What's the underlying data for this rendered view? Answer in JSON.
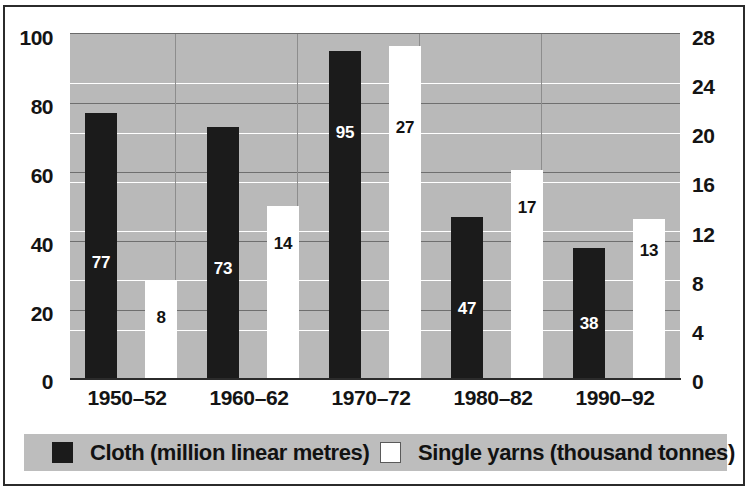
{
  "chart_data": {
    "type": "bar",
    "title": "",
    "subtitle": "",
    "xlabel": "",
    "categories": [
      "1950–52",
      "1960–62",
      "1970–72",
      "1980–82",
      "1990–92"
    ],
    "series": [
      {
        "name": "Cloth (million linear metres)",
        "axis": "left",
        "color": "#1b1b1b",
        "values": [
          77,
          73,
          95,
          47,
          38
        ]
      },
      {
        "name": "Single yarns (thousand tonnes)",
        "axis": "right",
        "color": "#ffffff",
        "values": [
          8,
          14,
          27,
          17,
          13
        ]
      }
    ],
    "left_axis": {
      "label": "",
      "ylim": [
        0,
        100
      ],
      "tick_step": 20,
      "ticks": [
        "0",
        "20",
        "40",
        "60",
        "80",
        "100"
      ]
    },
    "right_axis": {
      "label": "",
      "ylim": [
        0,
        28
      ],
      "tick_step": 4,
      "ticks": [
        "0",
        "4",
        "8",
        "12",
        "16",
        "20",
        "24",
        "28"
      ]
    },
    "grid": {
      "horizontal": true,
      "vertical": true,
      "left_gridline_color": "#6f6f6f",
      "right_gridline_color": "#ffffff",
      "vertical_gridline_color": "#8d8d8d"
    },
    "plot_background": "#b9b9b9",
    "legend": {
      "position": "bottom",
      "background": "#bdbdbd",
      "entries": [
        {
          "label": "Cloth (million linear metres)",
          "swatch": "filled-black"
        },
        {
          "label": "Single yarns (thousand tonnes)",
          "swatch": "outlined-white"
        }
      ]
    },
    "data_labels": {
      "cloth": [
        "77",
        "73",
        "95",
        "47",
        "38"
      ],
      "yarn": [
        "8",
        "14",
        "27",
        "17",
        "13"
      ]
    }
  }
}
